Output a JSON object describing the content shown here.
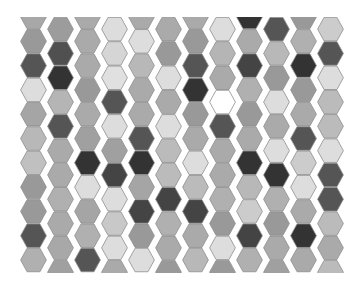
{
  "board": {
    "background": "#ffffff",
    "outline_color": "#8e8e8e",
    "columns": 12,
    "cells_per_column": 11,
    "origin_x": 20,
    "top_y": 17,
    "bottom_y": 273,
    "column_pitch": 27,
    "hex_width": 27,
    "hex_height": 24.3,
    "even_column_offset": -12.15,
    "column_colors": [
      [
        "#a8a8a8",
        "#999999",
        "#555555",
        "#dddddd",
        "#a5a5a5",
        "#b8b8b8",
        "#c0c0c0",
        "#999999",
        "#999999",
        "#555555",
        "#b0b0b0"
      ],
      [
        "#9c9c9c",
        "#505050",
        "#333333",
        "#b5b5b5",
        "#555555",
        "#aaaaaa",
        "#aaaaaa",
        "#b0b0b0",
        "#aaaaaa",
        "#a8a8a8",
        "#a0a0a0"
      ],
      [
        "#aaaaaa",
        "#aaaaaa",
        "#aaaaaa",
        "#999999",
        "#aaaaaa",
        "#a0a0a0",
        "#333333",
        "#dddddd",
        "#a5a5a5",
        "#b0b0b0",
        "#555555"
      ],
      [
        "#dddddd",
        "#d5d5d5",
        "#e0e0e0",
        "#555555",
        "#dddddd",
        "#a0a0a0",
        "#444444",
        "#dddddd",
        "#c8c8c8",
        "#dddddd",
        "#aaaaaa"
      ],
      [
        "#aaaaaa",
        "#dddddd",
        "#b8b8b8",
        "#aaaaaa",
        "#aaaaaa",
        "#555555",
        "#333333",
        "#a5a5a5",
        "#444444",
        "#999999",
        "#dddddd"
      ],
      [
        "#aaaaaa",
        "#999999",
        "#dddddd",
        "#aaaaaa",
        "#dddddd",
        "#bbbbbb",
        "#bbbbbb",
        "#444444",
        "#b0b0b0",
        "#aaaaaa",
        "#999999"
      ],
      [
        "#aaaaaa",
        "#999999",
        "#555555",
        "#333333",
        "#999999",
        "#aaaaaa",
        "#dddddd",
        "#bbbbbb",
        "#444444",
        "#aaaaaa",
        "#b8b8b8"
      ],
      [
        "#dddddd",
        "#b5b5b5",
        "#aaaaaa",
        "#ffffff",
        "#555555",
        "#aaaaaa",
        "#aaaaaa",
        "#b0b0b0",
        "#999999",
        "#dddddd",
        "#999999"
      ],
      [
        "#333333",
        "#aaaaaa",
        "#444444",
        "#b0b0b0",
        "#999999",
        "#aaaaaa",
        "#333333",
        "#b8b8b8",
        "#cccccc",
        "#444444",
        "#b0b0b0"
      ],
      [
        "#555555",
        "#b8b8b8",
        "#999999",
        "#dddddd",
        "#aaaaaa",
        "#dddddd",
        "#333333",
        "#b0b0b0",
        "#999999",
        "#aaaaaa",
        "#a0a0a0"
      ],
      [
        "#999999",
        "#b0b0b0",
        "#333333",
        "#999999",
        "#aaaaaa",
        "#555555",
        "#cccccc",
        "#dddddd",
        "#aaaaaa",
        "#333333",
        "#aaaaaa"
      ],
      [
        "#cccccc",
        "#555555",
        "#dddddd",
        "#bbbbbb",
        "#bbbbbb",
        "#dddddd",
        "#555555",
        "#555555",
        "#bbbbbb",
        "#aaaaaa",
        "#bbbbbb"
      ]
    ]
  }
}
